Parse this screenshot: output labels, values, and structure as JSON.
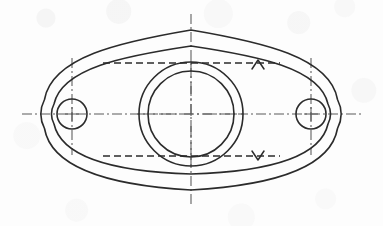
{
  "document": {
    "title": "Flange Gasket Part Drawing",
    "background_color": "#fdfdfd",
    "line_color": "#2b2b2b",
    "centerline_color": "#5a5a5a",
    "width": 383,
    "height": 226
  },
  "drawing": {
    "view_label": "front-view",
    "part_type": "two-bolt oval flange",
    "outline": {
      "name": "outer-profile",
      "description": "lens shaped outer boundary with rounded bosses at each end",
      "left_boss_center": [
        72,
        114
      ],
      "right_boss_center": [
        311,
        114
      ],
      "boss_outer_radius": 32,
      "top_apex": [
        191,
        30
      ],
      "bottom_apex": [
        191,
        190
      ],
      "stroke_width": 1.5
    },
    "inner_outline": {
      "name": "inner-profile",
      "description": "offset contour inside outer boundary",
      "top_apex": [
        191,
        46
      ],
      "bottom_apex": [
        191,
        174
      ],
      "boss_radius": 22,
      "stroke_width": 1.5
    },
    "bore": {
      "name": "central-bore",
      "center": [
        191,
        114
      ],
      "outer_radius": 52,
      "inner_radius": 43,
      "stroke_width": 1.5
    },
    "bolt_holes": [
      {
        "name": "bolt-hole-left",
        "center": [
          72,
          114
        ],
        "radius": 15,
        "center_mark_h": [
          54,
          90
        ],
        "center_mark_v": [
          58,
          155
        ]
      },
      {
        "name": "bolt-hole-right",
        "center": [
          311,
          114
        ],
        "radius": 15,
        "center_mark_h": [
          54,
          90
        ],
        "center_mark_v": [
          58,
          155
        ]
      }
    ],
    "centerlines": {
      "horizontal": {
        "name": "horizontal-centerline",
        "y": 114,
        "x1": 22,
        "x2": 363
      },
      "vertical": {
        "name": "vertical-centerline",
        "x": 191,
        "y1": 14,
        "y2": 206
      },
      "bore_horizontal": {
        "y": 114,
        "x1": 139,
        "x2": 243
      },
      "bore_vertical": {
        "x": 191,
        "y1": 62,
        "y2": 166
      },
      "hole_left_vertical": {
        "x": 72,
        "y1": 58,
        "y2": 155
      },
      "hole_right_vertical": {
        "x": 311,
        "y1": 58,
        "y2": 155
      },
      "dash_pattern": "10 3 2 3"
    },
    "section_lines": [
      {
        "name": "section-line-upper",
        "y": 63,
        "x1": 103,
        "x2": 280,
        "dash_pattern": "7 4",
        "arrow": {
          "name": "section-arrow-up",
          "glyph": "^",
          "direction": "up",
          "x": 258,
          "y": 63
        }
      },
      {
        "name": "section-line-lower",
        "y": 156,
        "x1": 103,
        "x2": 280,
        "dash_pattern": "7 4",
        "arrow": {
          "name": "section-arrow-down",
          "glyph": "v",
          "direction": "down",
          "x": 258,
          "y": 156
        }
      }
    ]
  }
}
